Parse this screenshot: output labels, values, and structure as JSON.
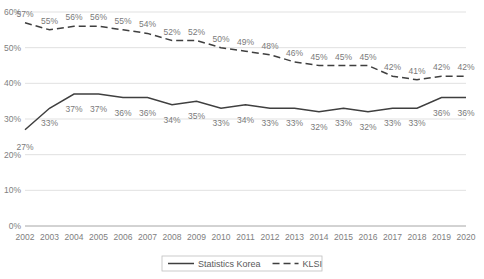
{
  "chart_data": {
    "type": "line",
    "title": "",
    "subtitle": "",
    "xlabel": "",
    "ylabel": "",
    "ylim": [
      0,
      60
    ],
    "yticks": [
      0,
      10,
      20,
      30,
      40,
      50,
      60
    ],
    "ytick_labels": [
      "0%",
      "10%",
      "20%",
      "30%",
      "40%",
      "50%",
      "60%"
    ],
    "grid": true,
    "legend_position": "bottom",
    "categories": [
      "2002",
      "2003",
      "2004",
      "2005",
      "2006",
      "2007",
      "2008",
      "2009",
      "2010",
      "2011",
      "2012",
      "2013",
      "2014",
      "2015",
      "2016",
      "2017",
      "2018",
      "2019",
      "2020"
    ],
    "series": [
      {
        "name": "Statistics Korea",
        "style": "solid",
        "color": "#3f3f3f",
        "values": [
          27,
          33,
          37,
          37,
          36,
          36,
          34,
          35,
          33,
          34,
          33,
          33,
          32,
          33,
          32,
          33,
          33,
          36,
          36
        ],
        "labels": [
          "27%",
          "33%",
          "37%",
          "37%",
          "36%",
          "36%",
          "34%",
          "35%",
          "33%",
          "34%",
          "33%",
          "33%",
          "32%",
          "33%",
          "32%",
          "33%",
          "33%",
          "36%",
          "36%"
        ]
      },
      {
        "name": "KLSI",
        "style": "dashed",
        "color": "#3f3f3f",
        "values": [
          57,
          55,
          56,
          56,
          55,
          54,
          52,
          52,
          50,
          49,
          48,
          46,
          45,
          45,
          45,
          42,
          41,
          42,
          42
        ],
        "labels": [
          "57%",
          "55%",
          "56%",
          "56%",
          "55%",
          "54%",
          "52%",
          "52%",
          "50%",
          "49%",
          "48%",
          "46%",
          "45%",
          "45%",
          "45%",
          "42%",
          "41%",
          "42%",
          "42%"
        ]
      }
    ]
  },
  "legend": {
    "items": [
      {
        "label": "Statistics Korea",
        "style": "solid"
      },
      {
        "label": "KLSI",
        "style": "dashed"
      }
    ]
  }
}
